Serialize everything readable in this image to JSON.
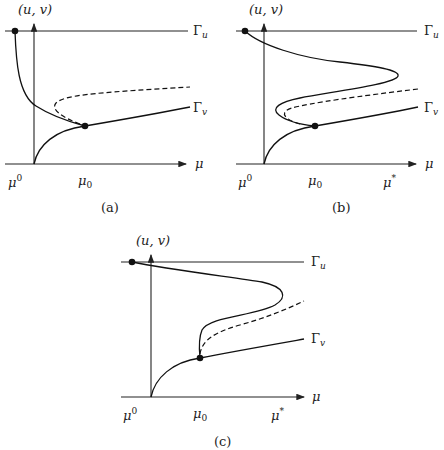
{
  "figure": {
    "panels": [
      {
        "id": "a",
        "caption": "(a)",
        "y_axis_label": "(u, v)",
        "x_axis_label": "μ",
        "top_line_label": "Γu",
        "lower_curve_label": "Γv",
        "x_ticks": [
          "μ0",
          "μ₀"
        ],
        "description": "Upper branch descends from Γu to meet Γv at μ₀; dashed unstable branch emerges from the junction"
      },
      {
        "id": "b",
        "caption": "(b)",
        "y_axis_label": "(u, v)",
        "x_axis_label": "μ",
        "top_line_label": "Γu",
        "lower_curve_label": "Γv",
        "x_ticks": [
          "μ0",
          "μ₀",
          "μ*"
        ],
        "description": "S-shaped branch from Γu folds back at μ* and again near μ₀ before joining Γv; dashed branch in between"
      },
      {
        "id": "c",
        "caption": "(c)",
        "y_axis_label": "(u, v)",
        "x_axis_label": "μ",
        "top_line_label": "Γu",
        "lower_curve_label": "Γv",
        "x_ticks": [
          "μ0",
          "μ₀",
          "μ*"
        ],
        "description": "Branch from Γu folds at μ* and descends vertically to Γv at μ₀; dashed branch from μ₀"
      }
    ],
    "labels": {
      "uv": "(u, v)",
      "mu": "μ",
      "gamma": "Γ",
      "sub_u": "u",
      "sub_v": "v",
      "mu_sup0_base": "μ",
      "mu_sup0": "0",
      "mu_sub0_base": "μ",
      "mu_sub0": "0",
      "mu_star_base": "μ",
      "mu_star": "*",
      "cap_a": "(a)",
      "cap_b": "(b)",
      "cap_c": "(c)"
    }
  }
}
